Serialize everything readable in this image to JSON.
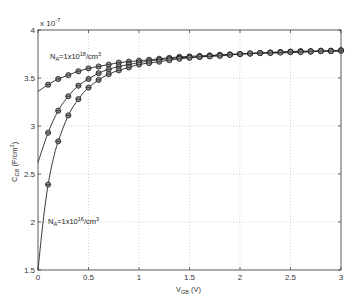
{
  "chart_data": {
    "type": "line",
    "title": "",
    "xlabel": "V_GB (V)",
    "xlabel_main": "V",
    "xlabel_sub": "GB",
    "xlabel_unit": " (V)",
    "ylabel": "C_GB (F/cm²)",
    "ylabel_main": "C",
    "ylabel_sub": "GB",
    "ylabel_unit": " (F/cm",
    "ylabel_sup": "2",
    "ylabel_close": ")",
    "y_multiplier": "x 10",
    "y_multiplier_exp": "-7",
    "xlim": [
      0,
      3
    ],
    "ylim": [
      1.5,
      4
    ],
    "y_scale": 1e-07,
    "grid": true,
    "x_ticks": [
      0,
      0.5,
      1,
      1.5,
      2,
      2.5,
      3
    ],
    "x_tick_labels": [
      "0",
      "0.5",
      "1",
      "1.5",
      "2",
      "2.5",
      "3"
    ],
    "y_ticks": [
      1.5,
      2,
      2.5,
      3,
      3.5,
      4
    ],
    "y_tick_labels": [
      "1.5",
      "2",
      "2.5",
      "3",
      "3.5",
      "4"
    ],
    "annotations": [
      {
        "text_main": "N",
        "text_sub": "A",
        "text_rest": "=1x10",
        "text_sup": "18",
        "text_end": "/cm",
        "text_sup2": "3",
        "x": 0.12,
        "y": 3.63
      },
      {
        "text_main": "N",
        "text_sub": "A",
        "text_rest": "=1x10",
        "text_sup": "16",
        "text_end": "/cm",
        "text_sup2": "3",
        "x": 0.1,
        "y": 1.98
      }
    ],
    "series": [
      {
        "name": "N_A=1x10^18/cm^3",
        "line_x": [
          0,
          0.1,
          0.2,
          0.3,
          0.4,
          0.5,
          0.6,
          0.7,
          0.8,
          0.9,
          1.0,
          1.2,
          1.4,
          1.6,
          1.8,
          2.0,
          2.2,
          2.4,
          2.6,
          2.8,
          3.0
        ],
        "line_y": [
          3.36,
          3.43,
          3.49,
          3.53,
          3.57,
          3.6,
          3.62,
          3.64,
          3.66,
          3.67,
          3.68,
          3.7,
          3.72,
          3.73,
          3.74,
          3.75,
          3.76,
          3.77,
          3.78,
          3.78,
          3.79
        ],
        "marker_x": [
          0.1,
          0.2,
          0.3,
          0.4,
          0.5,
          0.6,
          0.7,
          0.8,
          0.9,
          1.0,
          1.1,
          1.2,
          1.3,
          1.4,
          1.5,
          1.6,
          1.7,
          1.8,
          1.9,
          2.0,
          2.1,
          2.2,
          2.3,
          2.4,
          2.5,
          2.6,
          2.7,
          2.8,
          2.9,
          3.0
        ],
        "marker_y": [
          3.43,
          3.49,
          3.53,
          3.57,
          3.6,
          3.62,
          3.64,
          3.66,
          3.67,
          3.68,
          3.69,
          3.7,
          3.71,
          3.72,
          3.725,
          3.73,
          3.735,
          3.74,
          3.745,
          3.75,
          3.755,
          3.76,
          3.765,
          3.77,
          3.775,
          3.78,
          3.78,
          3.785,
          3.785,
          3.79
        ]
      },
      {
        "name": "N_A=1x10^17/cm^3",
        "line_x": [
          0,
          0.1,
          0.2,
          0.3,
          0.4,
          0.5,
          0.6,
          0.7,
          0.8,
          0.9,
          1.0,
          1.2,
          1.4,
          1.6,
          1.8,
          2.0,
          2.2,
          2.4,
          2.6,
          2.8,
          3.0
        ],
        "line_y": [
          2.62,
          2.93,
          3.16,
          3.31,
          3.42,
          3.49,
          3.55,
          3.59,
          3.62,
          3.64,
          3.66,
          3.69,
          3.71,
          3.72,
          3.74,
          3.75,
          3.76,
          3.77,
          3.77,
          3.78,
          3.78
        ],
        "marker_x": [
          0.1,
          0.2,
          0.3,
          0.4,
          0.5,
          0.6,
          0.7,
          0.8,
          0.9,
          1.0,
          1.1,
          1.2,
          1.3,
          1.4,
          1.5,
          1.6,
          1.7,
          1.8,
          1.9,
          2.0,
          2.1,
          2.2,
          2.3,
          2.4,
          2.5,
          2.6,
          2.7,
          2.8,
          2.9,
          3.0
        ],
        "marker_y": [
          2.93,
          3.16,
          3.31,
          3.42,
          3.49,
          3.55,
          3.59,
          3.62,
          3.64,
          3.66,
          3.675,
          3.69,
          3.7,
          3.71,
          3.715,
          3.72,
          3.73,
          3.74,
          3.745,
          3.75,
          3.755,
          3.76,
          3.765,
          3.77,
          3.77,
          3.775,
          3.775,
          3.78,
          3.78,
          3.785
        ]
      },
      {
        "name": "N_A=1x10^16/cm^3",
        "line_x": [
          0,
          0.05,
          0.1,
          0.15,
          0.2,
          0.3,
          0.4,
          0.5,
          0.6,
          0.7,
          0.8,
          0.9,
          1.0,
          1.2,
          1.4,
          1.6,
          1.8,
          2.0,
          2.2,
          2.4,
          2.6,
          2.8,
          3.0
        ],
        "line_y": [
          1.5,
          2.0,
          2.39,
          2.65,
          2.84,
          3.11,
          3.28,
          3.4,
          3.48,
          3.54,
          3.58,
          3.61,
          3.64,
          3.67,
          3.7,
          3.72,
          3.73,
          3.75,
          3.76,
          3.76,
          3.77,
          3.78,
          3.78
        ],
        "marker_x": [
          0.1,
          0.2,
          0.3,
          0.4,
          0.5,
          0.6,
          0.7,
          0.8,
          0.9,
          1.0,
          1.1,
          1.2,
          1.3,
          1.4,
          1.5,
          1.6,
          1.7,
          1.8,
          1.9,
          2.0,
          2.1,
          2.2,
          2.3,
          2.4,
          2.5,
          2.6,
          2.7,
          2.8,
          2.9,
          3.0
        ],
        "marker_y": [
          2.39,
          2.84,
          3.11,
          3.28,
          3.4,
          3.48,
          3.54,
          3.58,
          3.61,
          3.64,
          3.655,
          3.67,
          3.685,
          3.7,
          3.71,
          3.72,
          3.725,
          3.73,
          3.74,
          3.75,
          3.755,
          3.76,
          3.76,
          3.765,
          3.77,
          3.77,
          3.775,
          3.78,
          3.78,
          3.785
        ]
      }
    ]
  }
}
